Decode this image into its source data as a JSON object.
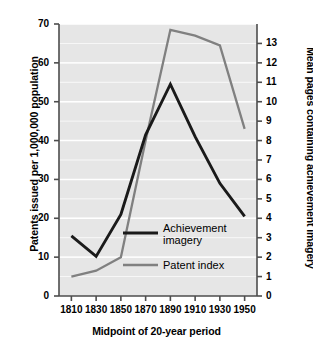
{
  "chart_data": {
    "type": "line",
    "title": "",
    "xlabel": "Midpoint of 20-year period",
    "ylabel": "Patents issued per 1,000,000 population",
    "ylabel_right": "Mean pages containing achievement imagery",
    "x": [
      1810,
      1830,
      1850,
      1870,
      1890,
      1910,
      1930,
      1950
    ],
    "xlim": [
      1800,
      1960
    ],
    "ylim": [
      0,
      70
    ],
    "ylim_right": [
      0,
      14
    ],
    "xticks": [
      1810,
      1830,
      1850,
      1870,
      1890,
      1910,
      1930,
      1950
    ],
    "yticks_left": [
      0,
      10,
      20,
      30,
      40,
      50,
      60,
      70
    ],
    "yticks_right": [
      0,
      1,
      2,
      3,
      4,
      5,
      6,
      7,
      8,
      9,
      10,
      11,
      12,
      13
    ],
    "grid": true,
    "legend_position": "center-right",
    "series": [
      {
        "name": "Achievement imagery",
        "axis": "right",
        "color": "#1a1a1a",
        "values_right_axis": [
          3.1,
          2.05,
          4.2,
          8.3,
          10.9,
          8.2,
          5.8,
          4.1
        ],
        "values_left_axis": [
          15.5,
          10.2,
          21.0,
          41.5,
          54.5,
          41.0,
          29.0,
          20.5
        ]
      },
      {
        "name": "Patent index",
        "axis": "left",
        "color": "#808080",
        "values_left_axis": [
          5.0,
          6.5,
          10.0,
          40.0,
          68.5,
          67.0,
          64.5,
          43.0
        ],
        "values_right_axis": [
          1.0,
          1.3,
          2.0,
          8.0,
          13.7,
          13.4,
          12.9,
          8.6
        ]
      }
    ],
    "legend": [
      {
        "label_line1": "Achievement",
        "label_line2": "imagery",
        "color": "#1a1a1a"
      },
      {
        "label_line1": "Patent index",
        "label_line2": "",
        "color": "#808080"
      }
    ],
    "plot_background": "#e6e6e6",
    "gridline_color": "#ffffff"
  },
  "axes": {
    "left_title": "Patents issued per 1,000,000 population",
    "right_title": "Mean pages containing achievement imagery",
    "x_title": "Midpoint of 20-year period",
    "left_ticks": [
      "70",
      "60",
      "50",
      "40",
      "30",
      "20",
      "10",
      "0"
    ],
    "right_ticks": [
      "13",
      "12",
      "11",
      "10",
      "9",
      "8",
      "7",
      "6",
      "5",
      "4",
      "3",
      "2",
      "1",
      "0"
    ],
    "x_ticks": [
      "1810",
      "1830",
      "1850",
      "1870",
      "1890",
      "1910",
      "1930",
      "1950"
    ]
  },
  "legend": {
    "item1_line1": "Achievement",
    "item1_line2": "imagery",
    "item2_line1": "Patent index"
  }
}
